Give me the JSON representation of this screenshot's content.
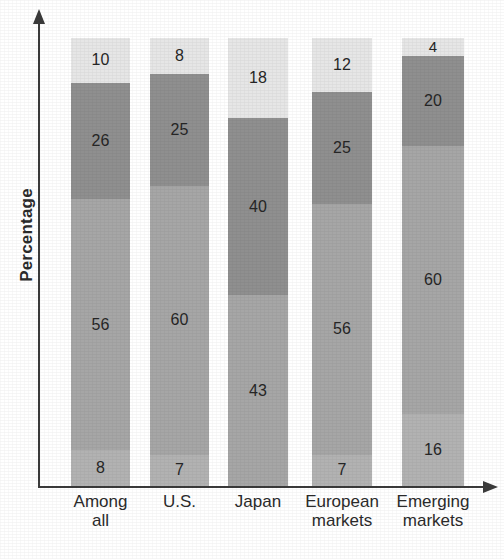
{
  "chart_data": {
    "type": "bar",
    "stacked": true,
    "title": "",
    "xlabel": "",
    "ylabel": "Percentage",
    "ylim": [
      0,
      100
    ],
    "grid": false,
    "legend": "none",
    "categories": [
      "Among\nall",
      "U.S.",
      "Japan",
      "European\nmarkets",
      "Emerging\nmarkets"
    ],
    "series": [
      {
        "name": "segment-1-bottom",
        "values": [
          8,
          7,
          0,
          7,
          16
        ],
        "color": "#b0b0b0"
      },
      {
        "name": "segment-2-middle",
        "values": [
          56,
          60,
          43,
          56,
          60
        ],
        "color": "#a6a6a6"
      },
      {
        "name": "segment-3-upper",
        "values": [
          26,
          25,
          40,
          25,
          20
        ],
        "color": "#8f8f8f"
      },
      {
        "name": "segment-4-top",
        "values": [
          10,
          8,
          18,
          12,
          4
        ],
        "color": "#e6e6e6"
      }
    ],
    "bars": [
      {
        "category": "Among\nall",
        "segments": [
          {
            "value": 10,
            "label": "10",
            "shade": "lightest"
          },
          {
            "value": 26,
            "label": "26",
            "shade": "dark"
          },
          {
            "value": 56,
            "label": "56",
            "shade": "medium"
          },
          {
            "value": 8,
            "label": "8",
            "shade": "light-medium"
          }
        ]
      },
      {
        "category": "U.S.",
        "segments": [
          {
            "value": 8,
            "label": "8",
            "shade": "lightest"
          },
          {
            "value": 25,
            "label": "25",
            "shade": "dark"
          },
          {
            "value": 60,
            "label": "60",
            "shade": "medium"
          },
          {
            "value": 7,
            "label": "7",
            "shade": "light-medium"
          }
        ]
      },
      {
        "category": "Japan",
        "segments": [
          {
            "value": 18,
            "label": "18",
            "shade": "lightest"
          },
          {
            "value": 40,
            "label": "40",
            "shade": "dark"
          },
          {
            "value": 43,
            "label": "43",
            "shade": "medium"
          }
        ]
      },
      {
        "category": "European\nmarkets",
        "segments": [
          {
            "value": 12,
            "label": "12",
            "shade": "lightest"
          },
          {
            "value": 25,
            "label": "25",
            "shade": "dark"
          },
          {
            "value": 56,
            "label": "56",
            "shade": "medium"
          },
          {
            "value": 7,
            "label": "7",
            "shade": "light-medium"
          }
        ]
      },
      {
        "category": "Emerging\nmarkets",
        "segments": [
          {
            "value": 4,
            "label": "4",
            "shade": "lightest"
          },
          {
            "value": 20,
            "label": "20",
            "shade": "dark"
          },
          {
            "value": 60,
            "label": "60",
            "shade": "medium"
          },
          {
            "value": 16,
            "label": "16",
            "shade": "light-medium"
          }
        ]
      }
    ],
    "shade_colors": {
      "lightest": "#e6e6e6",
      "dark": "#8f8f8f",
      "medium": "#a6a6a6",
      "light-medium": "#b2b2b2"
    },
    "axis_color": "#3a3a3a",
    "text_color": "#2b2b2b"
  },
  "axes": {
    "y_title": "Percentage",
    "x_labels": [
      "Among\nall",
      "U.S.",
      "Japan",
      "European\nmarkets",
      "Emerging\nmarkets"
    ]
  }
}
